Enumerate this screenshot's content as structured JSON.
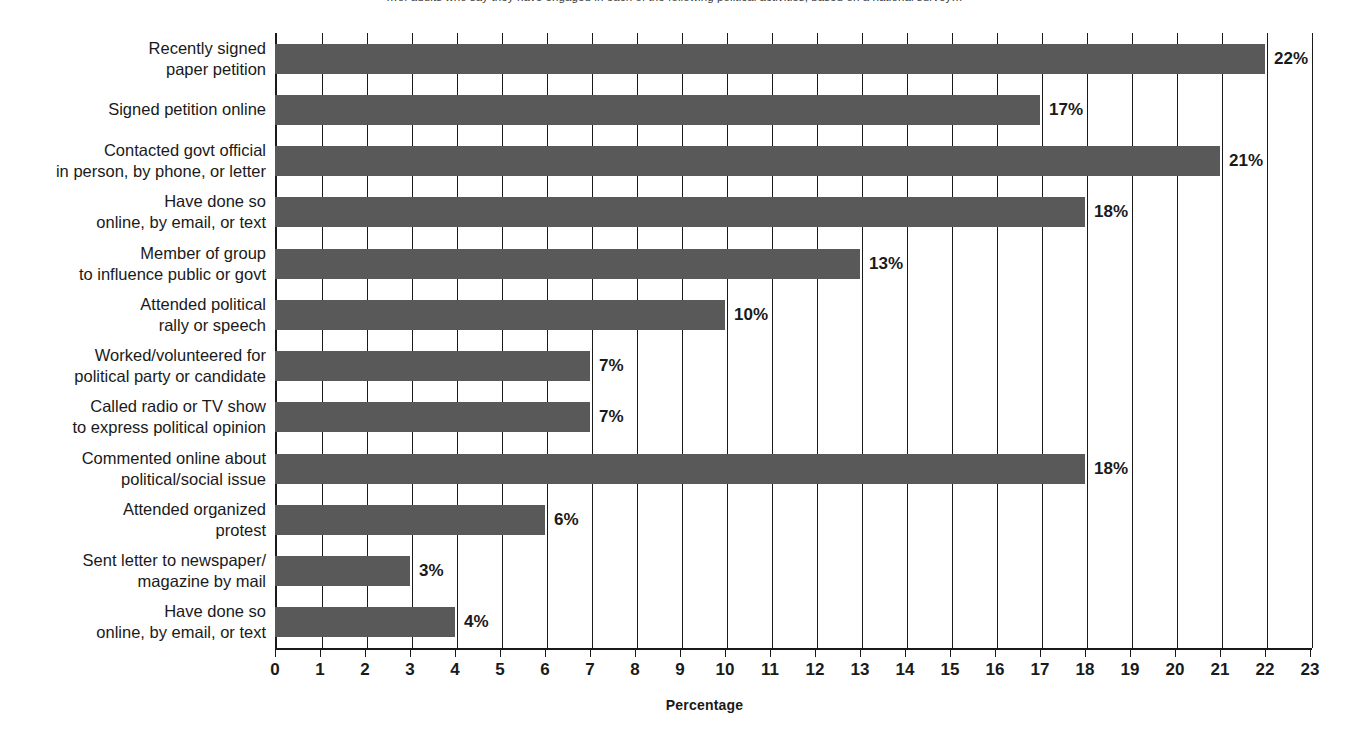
{
  "figure": {
    "top_note": "…of adults who say they have engaged in each of the following political activities, based on a national survey…"
  },
  "chart_data": {
    "type": "bar",
    "orientation": "horizontal",
    "title": "",
    "xlabel": "Percentage",
    "ylabel": "",
    "xlim": [
      0,
      23
    ],
    "xticks": [
      0,
      1,
      2,
      3,
      4,
      5,
      6,
      7,
      8,
      9,
      10,
      11,
      12,
      13,
      14,
      15,
      16,
      17,
      18,
      19,
      20,
      21,
      22,
      23
    ],
    "xtick_labels": [
      "0",
      "1",
      "2",
      "3",
      "4",
      "5",
      "6",
      "7",
      "8",
      "9",
      "10",
      "11",
      "12",
      "13",
      "14",
      "15",
      "16",
      "17",
      "18",
      "19",
      "20",
      "21",
      "22",
      "23"
    ],
    "grid": "vertical",
    "legend": "none",
    "bar_color": "#595959",
    "value_label_suffix": "%",
    "categories": [
      "Recently signed\npaper petition",
      "Signed petition online",
      "Contacted govt official\nin person, by phone, or letter",
      "Have done so\nonline, by email, or text",
      "Member of group\nto influence public or govt",
      "Attended political\nrally or speech",
      "Worked/volunteered for\npolitical party or candidate",
      "Called radio or TV show\nto express political opinion",
      "Commented online about\npolitical/social issue",
      "Attended organized\nprotest",
      "Sent letter to newspaper/\nmagazine by mail",
      "Have done so\nonline, by email, or text"
    ],
    "values": [
      22,
      17,
      21,
      18,
      13,
      10,
      7,
      7,
      18,
      6,
      3,
      4
    ],
    "value_labels": [
      "22%",
      "17%",
      "21%",
      "18%",
      "13%",
      "10%",
      "7%",
      "7%",
      "18%",
      "6%",
      "3%",
      "4%"
    ]
  }
}
